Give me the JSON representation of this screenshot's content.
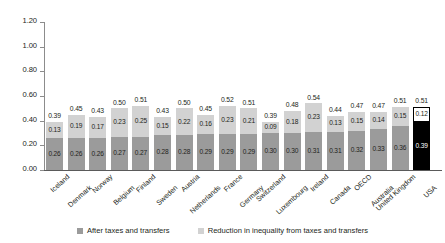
{
  "chart_data": {
    "type": "bar",
    "subtype": "stacked-bar",
    "title": "",
    "subtitle": "",
    "xlabel": "",
    "ylabel": "",
    "ylim": [
      0.0,
      1.2
    ],
    "ytick_labels": [
      "0.00",
      "0.20",
      "0.40",
      "0.60",
      "0.80",
      "1.00",
      "1.20"
    ],
    "ytick_values": [
      0.0,
      0.2,
      0.4,
      0.6,
      0.8,
      1.0,
      1.2
    ],
    "grid": false,
    "legend_position": "bottom",
    "categories": [
      "Iceland",
      "Denmark",
      "Norway",
      "Belgium",
      "Finland",
      "Sweden",
      "Austria",
      "Netherlands",
      "France",
      "Germany",
      "Switzerland",
      "Luxembourg",
      "Ireland",
      "Canada",
      "OECD",
      "Australia",
      "United Kingdom",
      "USA"
    ],
    "series": [
      {
        "name": "After taxes and transfers",
        "color": "#9b9b9b",
        "values": [
          0.26,
          0.26,
          0.26,
          0.27,
          0.27,
          0.28,
          0.28,
          0.29,
          0.29,
          0.29,
          0.3,
          0.3,
          0.31,
          0.31,
          0.32,
          0.33,
          0.36,
          0.39
        ],
        "labels": [
          "0.26",
          "0.26",
          "0.26",
          "0.27",
          "0.27",
          "0.28",
          "0.28",
          "0.29",
          "0.29",
          "0.29",
          "0.30",
          "0.30",
          "0.31",
          "0.31",
          "0.32",
          "0.33",
          "0.36",
          "0.39"
        ]
      },
      {
        "name": "Reduction in inequality from taxes and transfers",
        "color": "#d2d2d2",
        "values": [
          0.13,
          0.19,
          0.17,
          0.23,
          0.25,
          0.15,
          0.22,
          0.16,
          0.23,
          0.21,
          0.09,
          0.18,
          0.23,
          0.13,
          0.15,
          0.14,
          0.15,
          0.12
        ],
        "labels": [
          "0.13",
          "0.19",
          "0.17",
          "0.23",
          "0.25",
          "0.15",
          "0.22",
          "0.16",
          "0.23",
          "0.21",
          "0.09",
          "0.18",
          "0.23",
          "0.13",
          "0.15",
          "0.14",
          "0.15",
          "0.12"
        ]
      }
    ],
    "totals": [
      0.39,
      0.45,
      0.43,
      0.5,
      0.51,
      0.43,
      0.5,
      0.45,
      0.52,
      0.51,
      0.39,
      0.48,
      0.54,
      0.44,
      0.47,
      0.47,
      0.51,
      0.51
    ],
    "total_labels": [
      "0.39",
      "0.45",
      "0.43",
      "0.50",
      "0.51",
      "0.43",
      "0.50",
      "0.45",
      "0.52",
      "0.51",
      "0.39",
      "0.48",
      "0.54",
      "0.44",
      "0.47",
      "0.47",
      "0.51",
      "0.51"
    ],
    "highlighted_category": "USA",
    "highlight_colors": {
      "lower": "#000000",
      "upper": "#ffffff",
      "outline": "#000000"
    }
  },
  "legend": {
    "items": [
      {
        "label": "After taxes and transfers",
        "color": "#9b9b9b"
      },
      {
        "label": "Reduction in inequality from taxes and transfers",
        "color": "#d2d2d2"
      }
    ]
  }
}
